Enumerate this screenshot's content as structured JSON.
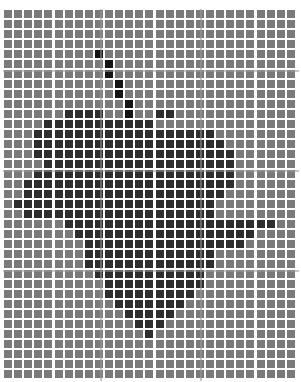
{
  "grid": {
    "columns": 29,
    "rows": 37,
    "pitch_x": 10.1,
    "pitch_y": 10,
    "colors": {
      ".": "#7a7a7a",
      "#": "#2e2e2e",
      "X": "#141414"
    },
    "guides": {
      "vertical_x": [
        100,
        200
      ],
      "horizontal_y": [
        70,
        170,
        270
      ]
    },
    "pixels": [
      ".............................",
      ".............................",
      ".............................",
      ".............................",
      ".........X...................",
      "..........X..................",
      "..........X..................",
      "...........X.................",
      "...........X.................",
      "............X................",
      "......####..X..##............",
      "....###########..............",
      "...##################........",
      "...###################.......",
      "...####################......",
      "....###################......",
      "...####################......",
      "..#####################......",
      "..####################.......",
      ".####################........",
      "..###################........",
      "......#####################..",
      ".......##################....",
      "........################.....",
      "........#############........",
      "........#############........",
      ".........###########.........",
      "..........##########.........",
      "..........#########..........",
      "...........#######...........",
      "............#####............",
      ".............###.............",
      "..............#..............",
      ".............................",
      ".............................",
      ".............................",
      "............................."
    ]
  }
}
